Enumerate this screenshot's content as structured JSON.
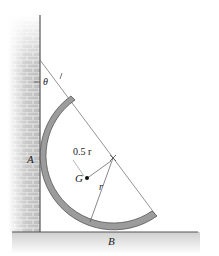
{
  "figure": {
    "labels": {
      "theta": "θ",
      "point_a": "A",
      "point_b": "B",
      "point_g": "G",
      "dim_half_r": "0.5 r",
      "dim_r": "r"
    },
    "elements": {
      "wall": "brick-wall",
      "floor": "ground-surface",
      "body": "semicircular-hoop-arc",
      "center_mark": "center-cross"
    },
    "colors": {
      "arc_fill": "#9a9a9a",
      "arc_edge": "#555555",
      "brick": "#bdbdbd",
      "mortar": "#e6e6e6",
      "ground": "#d8d8d8",
      "line": "#444444"
    }
  }
}
